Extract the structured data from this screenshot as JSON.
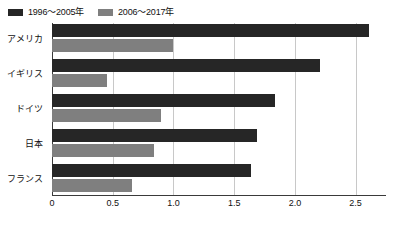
{
  "chart_data": {
    "type": "bar",
    "orientation": "horizontal",
    "title": "",
    "subtitle": "",
    "xlabel": "",
    "ylabel": "",
    "categories": [
      "アメリカ",
      "イギリス",
      "ドイツ",
      "日本",
      "フランス"
    ],
    "series": [
      {
        "name": "1996〜2005年",
        "color": "#262626",
        "values": [
          2.61,
          2.21,
          1.84,
          1.69,
          1.64
        ]
      },
      {
        "name": "2006〜2017年",
        "color": "#7f7f7f",
        "values": [
          1.0,
          0.45,
          0.9,
          0.84,
          0.66
        ]
      }
    ],
    "xlim": [
      0,
      2.75
    ],
    "xticks": [
      0,
      0.5,
      1.0,
      1.5,
      2.0,
      2.5
    ],
    "xtick_labels": [
      "0",
      "0.5",
      "1.0",
      "1.5",
      "2.0",
      "2.5"
    ],
    "grid": "vertical",
    "legend_position": "top-left"
  },
  "legend": {
    "items": [
      {
        "label": "1996〜2005年",
        "color": "#262626",
        "swatch_name": "legend-swatch-series-a"
      },
      {
        "label": "2006〜2017年",
        "color": "#7f7f7f",
        "swatch_name": "legend-swatch-series-b"
      }
    ]
  },
  "axis": {
    "ticks": [
      {
        "label": "0",
        "value": 0
      },
      {
        "label": "0.5",
        "value": 0.5
      },
      {
        "label": "1.0",
        "value": 1.0
      },
      {
        "label": "1.5",
        "value": 1.5
      },
      {
        "label": "2.0",
        "value": 2.0
      },
      {
        "label": "2.5",
        "value": 2.5
      }
    ]
  }
}
